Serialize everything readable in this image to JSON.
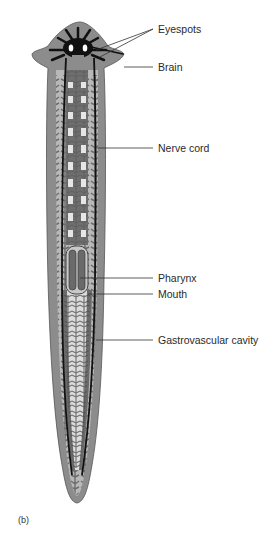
{
  "figure": {
    "panel_label": "(b)",
    "colors": {
      "body_outer": "#8a8a8a",
      "body_margin": "#b5b5b5",
      "gut": "#6e6e6e",
      "gut_light": "#d9d9d9",
      "nerve": "#111111",
      "label_line": "#333333"
    },
    "labels": [
      {
        "id": "eyespots",
        "text": "Eyespots"
      },
      {
        "id": "brain",
        "text": "Brain"
      },
      {
        "id": "nerve-cord",
        "text": "Nerve cord"
      },
      {
        "id": "pharynx",
        "text": "Pharynx"
      },
      {
        "id": "mouth",
        "text": "Mouth"
      },
      {
        "id": "gastrovascular-cavity",
        "text": "Gastrovascular cavity"
      }
    ]
  }
}
